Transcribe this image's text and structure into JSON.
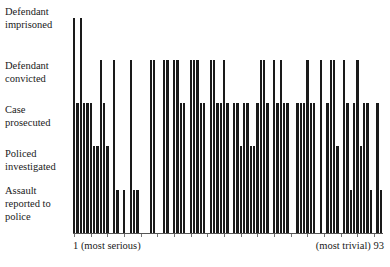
{
  "chart_data": {
    "type": "bar",
    "title": "",
    "xlabel": "",
    "ylabel": "",
    "x_start_label": "1 (most serious)",
    "x_end_label": "(most trivial) 93",
    "levels": [
      "",
      "Assault reported to police",
      "Policed investigated",
      "Case prosecuted",
      "Defendant convicted",
      "Defendant imprisoned"
    ],
    "ylim": [
      0,
      5
    ],
    "grid": false,
    "legend": "none",
    "categories_count": 93,
    "values": [
      5,
      3,
      5,
      3,
      3,
      3,
      2,
      2,
      4,
      3,
      2,
      0,
      4,
      1,
      0,
      1,
      0,
      4,
      1,
      1,
      0,
      0,
      0,
      4,
      4,
      0,
      0,
      4,
      4,
      0,
      4,
      4,
      3,
      3,
      0,
      4,
      4,
      4,
      3,
      3,
      0,
      4,
      4,
      3,
      3,
      4,
      3,
      0,
      3,
      3,
      2,
      3,
      3,
      2,
      2,
      3,
      4,
      4,
      3,
      0,
      4,
      3,
      4,
      3,
      3,
      0,
      0,
      3,
      3,
      3,
      4,
      3,
      3,
      0,
      4,
      0,
      3,
      4,
      4,
      2,
      0,
      4,
      3,
      1,
      3,
      4,
      2,
      3,
      3,
      1,
      0,
      3,
      1
    ]
  },
  "labels": {
    "imprisoned": [
      "Defendant",
      "imprisoned"
    ],
    "convicted": [
      "Defendant",
      "convicted"
    ],
    "prosecuted": [
      "Case",
      "prosecuted"
    ],
    "investigated": [
      "Policed",
      "investigated"
    ],
    "reported": [
      "Assault",
      "reported to",
      "police"
    ]
  },
  "axis": {
    "start": "1 (most serious)",
    "end": "(most trivial) 93"
  }
}
